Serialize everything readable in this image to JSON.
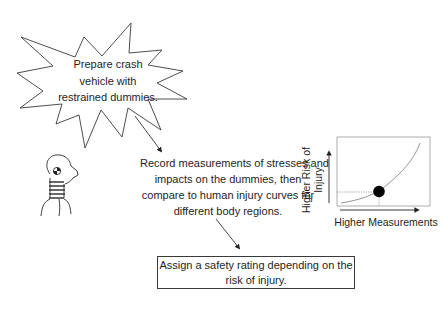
{
  "diagram": {
    "steps": [
      {
        "id": "prepare",
        "shape": "starburst",
        "lines": [
          "Prepare crash",
          "vehicle with",
          "restrained dummies."
        ]
      },
      {
        "id": "record",
        "shape": "plain-text",
        "lines": [
          "Record measurements of stresses and",
          "impacts on the dummies, then",
          "compare to human injury curves for",
          "different body regions."
        ]
      },
      {
        "id": "rating",
        "shape": "rectangle",
        "lines": [
          "Assign a safety rating depending on the",
          "risk of injury."
        ]
      }
    ],
    "arrows": [
      {
        "from": "prepare",
        "to": "record"
      },
      {
        "from": "record",
        "to": "rating"
      }
    ],
    "illustrations": {
      "dummy": "crash-test-dummy-icon",
      "injury_curve": {
        "ylabel": "Higher Risk of Injury",
        "ylabel_lines": [
          "Higher Risk of",
          "Injury"
        ],
        "xlabel": "Higher Measurements",
        "curve": "exponential-increasing",
        "marker": "filled-black-dot"
      }
    },
    "colors": {
      "stroke": "#3a3a3a",
      "text": "#1e1e1e",
      "curve": "#8a8a8a",
      "dotted_guides": "#9a9a9a",
      "marker": "#000000",
      "background": "#ffffff"
    }
  }
}
